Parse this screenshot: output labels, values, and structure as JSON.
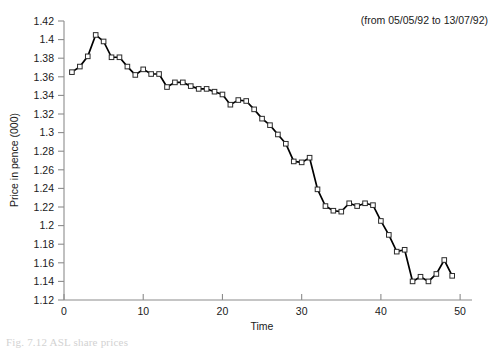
{
  "chart_data": {
    "type": "line",
    "title": "",
    "xlabel": "Time",
    "ylabel": "Price in pence (000)",
    "annotation": "(from 05/05/92 to 13/07/92)",
    "xlim": [
      0,
      51.5
    ],
    "ylim": [
      1.12,
      1.42
    ],
    "xticks": [
      0,
      10,
      20,
      30,
      40,
      50
    ],
    "xtick_labels": [
      "0",
      "10",
      "20",
      "30",
      "40",
      "50"
    ],
    "yticks": [
      1.12,
      1.14,
      1.16,
      1.18,
      1.2,
      1.22,
      1.24,
      1.26,
      1.28,
      1.3,
      1.32,
      1.34,
      1.36,
      1.38,
      1.4,
      1.42
    ],
    "ytick_labels": [
      "1.12",
      "1.14",
      "1.16",
      "1.18",
      "1.2",
      "1.22",
      "1.24",
      "1.26",
      "1.28",
      "1.3",
      "1.32",
      "1.34",
      "1.36",
      "1.38",
      "1.4",
      "1.42"
    ],
    "grid": false,
    "legend": false,
    "marker": "open-square",
    "line_color": "#000000",
    "marker_face_color": "#ffffff",
    "marker_edge_color": "#2b2b2b",
    "x": [
      1,
      2,
      3,
      4,
      5,
      6,
      7,
      8,
      9,
      10,
      11,
      12,
      13,
      14,
      15,
      16,
      17,
      18,
      19,
      20,
      21,
      22,
      23,
      24,
      25,
      26,
      27,
      28,
      29,
      30,
      31,
      32,
      33,
      34,
      35,
      36,
      37,
      38,
      39,
      40,
      41,
      42,
      43,
      44,
      45,
      46,
      47,
      48,
      49
    ],
    "values": [
      1.365,
      1.371,
      1.382,
      1.405,
      1.398,
      1.381,
      1.381,
      1.371,
      1.362,
      1.368,
      1.363,
      1.363,
      1.349,
      1.354,
      1.354,
      1.35,
      1.347,
      1.347,
      1.344,
      1.341,
      1.33,
      1.335,
      1.334,
      1.325,
      1.315,
      1.308,
      1.298,
      1.288,
      1.269,
      1.268,
      1.273,
      1.239,
      1.221,
      1.216,
      1.215,
      1.224,
      1.221,
      1.224,
      1.222,
      1.205,
      1.19,
      1.172,
      1.174,
      1.14,
      1.145,
      1.14,
      1.148,
      1.163,
      1.146
    ],
    "caption": "Fig. 7.12 ASL share prices"
  }
}
